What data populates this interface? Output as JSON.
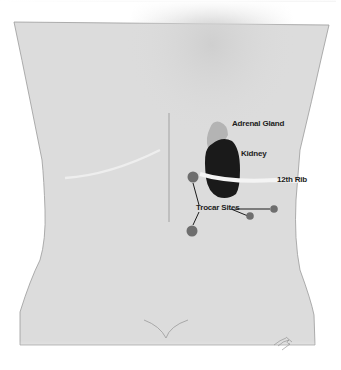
{
  "figure": {
    "colors": {
      "skin": "#dcdcdc",
      "outline": "#9a9a9a",
      "kidney": "#1a1a1a",
      "adrenal": "#b4b4b4",
      "rib": "#f2f2f2",
      "trocar": "#6e6e6e",
      "leader_line": "#1c1c1c"
    },
    "labels": {
      "adrenal_gland": "Adrenal Gland",
      "kidney": "Kidney",
      "rib": "12th Rib",
      "trocar_sites": "Trocar Sites"
    },
    "trocar_sites": [
      {
        "name": "upper-left-port",
        "x": 193,
        "y": 177
      },
      {
        "name": "lower-left-port",
        "x": 193,
        "y": 230
      },
      {
        "name": "middle-port",
        "x": 250,
        "y": 216
      },
      {
        "name": "right-port",
        "x": 274,
        "y": 209
      }
    ],
    "signature": "artist signature"
  }
}
